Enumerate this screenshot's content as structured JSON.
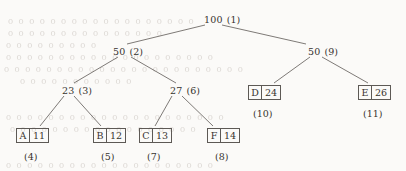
{
  "diagram": {
    "type": "binary-huffman-tree",
    "title": "",
    "internal_nodes": [
      {
        "id": "n1",
        "weight": "100",
        "index": "(1)",
        "x": 204,
        "y": 14
      },
      {
        "id": "n2",
        "weight": "50",
        "index": "(2)",
        "x": 113,
        "y": 46
      },
      {
        "id": "n9",
        "weight": "50",
        "index": "(9)",
        "x": 308,
        "y": 46
      },
      {
        "id": "n3",
        "weight": "23",
        "index": "(3)",
        "x": 62,
        "y": 85
      },
      {
        "id": "n6",
        "weight": "27",
        "index": "(6)",
        "x": 170,
        "y": 85
      }
    ],
    "leaf_nodes": [
      {
        "id": "l4",
        "symbol": "A",
        "weight": "11",
        "index": "(4)",
        "x": 16,
        "y": 128,
        "idx_x": 24,
        "idx_y": 151
      },
      {
        "id": "l5",
        "symbol": "B",
        "weight": "12",
        "index": "(5)",
        "x": 93,
        "y": 128,
        "idx_x": 101,
        "idx_y": 151
      },
      {
        "id": "l7",
        "symbol": "C",
        "weight": "13",
        "index": "(7)",
        "x": 139,
        "y": 128,
        "idx_x": 147,
        "idx_y": 151
      },
      {
        "id": "l8",
        "symbol": "F",
        "weight": "14",
        "index": "(8)",
        "x": 207,
        "y": 128,
        "idx_x": 215,
        "idx_y": 151
      },
      {
        "id": "l10",
        "symbol": "D",
        "weight": "24",
        "index": "(10)",
        "x": 248,
        "y": 85,
        "idx_x": 253,
        "idx_y": 108
      },
      {
        "id": "l11",
        "symbol": "E",
        "weight": "26",
        "index": "(11)",
        "x": 358,
        "y": 85,
        "idx_x": 363,
        "idx_y": 108
      }
    ],
    "edges": [
      {
        "from": "n1",
        "to": "n2",
        "x1": 205,
        "y1": 25,
        "x2": 127,
        "y2": 44
      },
      {
        "from": "n1",
        "to": "n9",
        "x1": 222,
        "y1": 25,
        "x2": 306,
        "y2": 44
      },
      {
        "from": "n2",
        "to": "n3",
        "x1": 118,
        "y1": 57,
        "x2": 74,
        "y2": 83
      },
      {
        "from": "n2",
        "to": "n6",
        "x1": 131,
        "y1": 57,
        "x2": 176,
        "y2": 83
      },
      {
        "from": "n3",
        "to": "l4",
        "x1": 64,
        "y1": 96,
        "x2": 40,
        "y2": 126
      },
      {
        "from": "n3",
        "to": "l5",
        "x1": 74,
        "y1": 96,
        "x2": 101,
        "y2": 126
      },
      {
        "from": "n6",
        "to": "l7",
        "x1": 172,
        "y1": 96,
        "x2": 155,
        "y2": 126
      },
      {
        "from": "n6",
        "to": "l8",
        "x1": 182,
        "y1": 96,
        "x2": 213,
        "y2": 126
      },
      {
        "from": "n9",
        "to": "l10",
        "x1": 310,
        "y1": 57,
        "x2": 274,
        "y2": 83
      },
      {
        "from": "n9",
        "to": "l11",
        "x1": 322,
        "y1": 57,
        "x2": 368,
        "y2": 83
      }
    ],
    "background_ghost_text": [
      {
        "text": "o o o o o o o   o o  o o  o o o    o o o o",
        "x": 8,
        "y": 16
      },
      {
        "text": "o o o o o o   o o o o   o o o o o",
        "x": 8,
        "y": 28
      },
      {
        "text": "o  o o o o  o o  o o",
        "x": 6,
        "y": 40
      },
      {
        "text": "o o o o o o   o o o o      o o  o o o o o  o  o o",
        "x": 6,
        "y": 52
      },
      {
        "text": "o o o o o o  o o o    o o o o  o o  o o o o o o  o o",
        "x": 4,
        "y": 64
      },
      {
        "text": "o o o o o     o o  o o o o",
        "x": 20,
        "y": 76
      },
      {
        "text": "o o o o o   o o o o o o o  o o o    o o o o o o",
        "x": 6,
        "y": 112
      },
      {
        "text": "o o o  o o o o o o o o o     o o  o o o o",
        "x": 10,
        "y": 124
      },
      {
        "text": "o o o o   o o  o o o o     o o o o o o  o o o o",
        "x": 6,
        "y": 160
      }
    ]
  }
}
